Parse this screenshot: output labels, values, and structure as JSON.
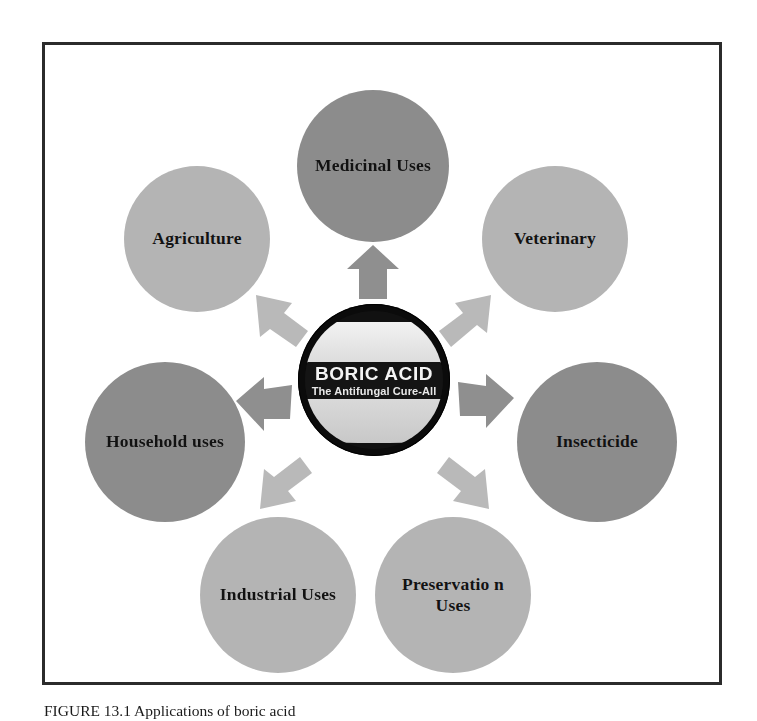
{
  "figure": {
    "caption_label": "FIGURE 13.1",
    "caption_text": "Applications of boric acid",
    "border_color": "#2b2b2b"
  },
  "center": {
    "logo_title": "BORIC ACID",
    "logo_subtitle": "The Antifungal Cure-All",
    "ring_color": "#0b0b0b",
    "band_color": "#141414"
  },
  "colors": {
    "node_dark": "#8c8c8c",
    "node_light": "#b4b4b4",
    "arrow_dark": "#8f8f8f",
    "arrow_light": "#b9b9b9",
    "text": "#121212",
    "background": "#ffffff"
  },
  "nodes": [
    {
      "id": "medicinal",
      "label": "Medicinal Uses",
      "shade": "dark",
      "position": "top"
    },
    {
      "id": "veterinary",
      "label": "Veterinary",
      "shade": "light",
      "position": "top-right"
    },
    {
      "id": "insecticide",
      "label": "Insecticide",
      "shade": "dark",
      "position": "right"
    },
    {
      "id": "preservation",
      "label": "Preservatio n Uses",
      "shade": "light",
      "position": "bottom-right"
    },
    {
      "id": "industrial",
      "label": "Industrial Uses",
      "shade": "light",
      "position": "bottom-left"
    },
    {
      "id": "household",
      "label": "Household uses",
      "shade": "dark",
      "position": "left"
    },
    {
      "id": "agriculture",
      "label": "Agriculture",
      "shade": "light",
      "position": "top-left"
    }
  ],
  "arrows": [
    {
      "id": "up",
      "direction": "up",
      "target": "medicinal",
      "shade": "dark"
    },
    {
      "id": "up-left",
      "direction": "up-left",
      "target": "agriculture",
      "shade": "light"
    },
    {
      "id": "up-right",
      "direction": "up-right",
      "target": "veterinary",
      "shade": "light"
    },
    {
      "id": "left",
      "direction": "left",
      "target": "household",
      "shade": "dark"
    },
    {
      "id": "right",
      "direction": "right",
      "target": "insecticide",
      "shade": "dark"
    },
    {
      "id": "down-left",
      "direction": "down-left",
      "target": "industrial",
      "shade": "light"
    },
    {
      "id": "down-right",
      "direction": "down-right",
      "target": "preservation",
      "shade": "light"
    }
  ]
}
